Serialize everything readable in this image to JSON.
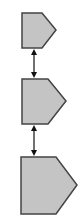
{
  "diagram": {
    "type": "vertical-chain",
    "colors": {
      "fill": "#c4c4c4",
      "stroke": "#444444",
      "arrow": "#111111",
      "background": "#ffffff"
    },
    "nodes": [
      {
        "id": "pentagon-1",
        "shape": "pentagon-arrow-right",
        "size": "small"
      },
      {
        "id": "pentagon-2",
        "shape": "pentagon-arrow-right",
        "size": "medium"
      },
      {
        "id": "pentagon-3",
        "shape": "pentagon-arrow-right",
        "size": "large"
      }
    ],
    "edges": [
      {
        "from": "pentagon-1",
        "to": "pentagon-2",
        "direction": "bidirectional"
      },
      {
        "from": "pentagon-2",
        "to": "pentagon-3",
        "direction": "bidirectional"
      }
    ]
  }
}
